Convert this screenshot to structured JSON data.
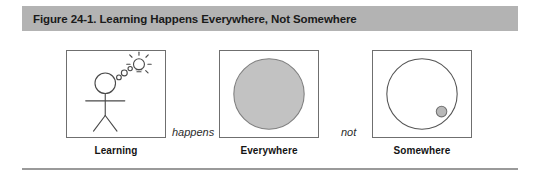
{
  "figure": {
    "caption": "Figure 24-1. Learning Happens Everywhere, Not Somewhere",
    "caption_bar_color": "#b3b3b3",
    "rule_color": "#9a9a9a",
    "panel_border_color": "#6f6f6f",
    "fill_gray": "#c2c2c2",
    "stroke_dark": "#4a4a4a"
  },
  "panels": [
    {
      "id": "learning",
      "label": "Learning",
      "icon": "stick-figure-with-lightbulb-idea"
    },
    {
      "id": "everywhere",
      "label": "Everywhere",
      "icon": "large-filled-gray-circle"
    },
    {
      "id": "somewhere",
      "label": "Somewhere",
      "icon": "large-outline-circle-with-small-gray-dot"
    }
  ],
  "connectors": [
    {
      "id": "happens",
      "text": "happens"
    },
    {
      "id": "not",
      "text": "not"
    }
  ]
}
